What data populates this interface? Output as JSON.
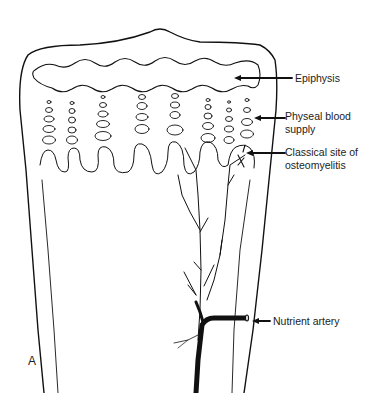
{
  "figure": {
    "panel_label": "A",
    "labels": {
      "epiphysis": "Epiphysis",
      "physeal_line1": "Physeal blood",
      "physeal_line2": "supply",
      "osteo_line1": "Classical site of",
      "osteo_line2": "osteomyelitis",
      "nutrient": "Nutrient artery"
    },
    "colors": {
      "ink": "#111111",
      "background": "#ffffff"
    }
  }
}
